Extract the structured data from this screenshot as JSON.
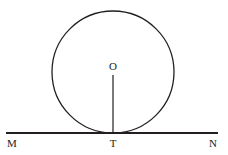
{
  "figure": {
    "background_color": "#ffffff",
    "stroke_color": "#231f20",
    "label_color": "#1c1c1c",
    "width": 228,
    "height": 155
  },
  "labels": {
    "centre": "O",
    "tangent_point": "T",
    "line_left_end": "M",
    "line_right_end": "N"
  },
  "geometry": {
    "circle": {
      "name": "circle-O",
      "center_x": 113,
      "center_y": 72,
      "radius": 61,
      "stroke_width": 1.3
    },
    "tangent_line": {
      "name": "line-MN",
      "x1": 6,
      "y1": 133,
      "x2": 218,
      "y2": 133,
      "stroke_width": 1.8
    },
    "radius_segment": {
      "name": "segment-OT",
      "x1": 113,
      "y1": 75,
      "x2": 113,
      "y2": 133,
      "stroke_width": 1.2
    }
  },
  "label_positions": {
    "centre": {
      "x": 113,
      "y": 66
    },
    "tangent_point": {
      "x": 113,
      "y": 143
    },
    "line_left_end": {
      "x": 12,
      "y": 143
    },
    "line_right_end": {
      "x": 213,
      "y": 143
    }
  }
}
